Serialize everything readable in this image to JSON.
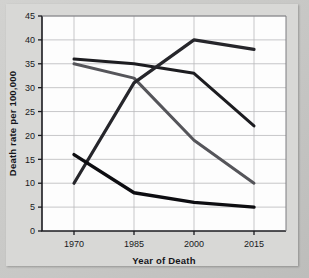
{
  "figure": {
    "background_color": "#c9c9c7",
    "plot_background_color": "#fdfdfd"
  },
  "chart_data": {
    "type": "line",
    "title": "",
    "xlabel": "Year of Death",
    "ylabel": "Death rate per 100,000",
    "x": [
      1970,
      1985,
      2000,
      2015
    ],
    "xticklabels": [
      "1970",
      "1985",
      "2000",
      "2015"
    ],
    "yticks": [
      0,
      5,
      10,
      15,
      20,
      25,
      30,
      35,
      40,
      45
    ],
    "yticklabels": [
      "0",
      "5",
      "10",
      "15",
      "20",
      "25",
      "30",
      "35",
      "40",
      "45"
    ],
    "xlim": [
      1962,
      2023
    ],
    "ylim": [
      0,
      45
    ],
    "grid": true,
    "legend": "none",
    "series": [
      {
        "name": "series-1",
        "values": [
          36,
          35,
          33,
          22
        ],
        "color": "#1c1c20",
        "width": 3.0
      },
      {
        "name": "series-2",
        "values": [
          35,
          32,
          19,
          10
        ],
        "color": "#55555a",
        "width": 3.0
      },
      {
        "name": "series-3",
        "values": [
          10,
          31,
          40,
          38
        ],
        "color": "#26262b",
        "width": 3.2
      },
      {
        "name": "series-4",
        "values": [
          16,
          8,
          6,
          5
        ],
        "color": "#0d0d11",
        "width": 3.4
      }
    ]
  }
}
